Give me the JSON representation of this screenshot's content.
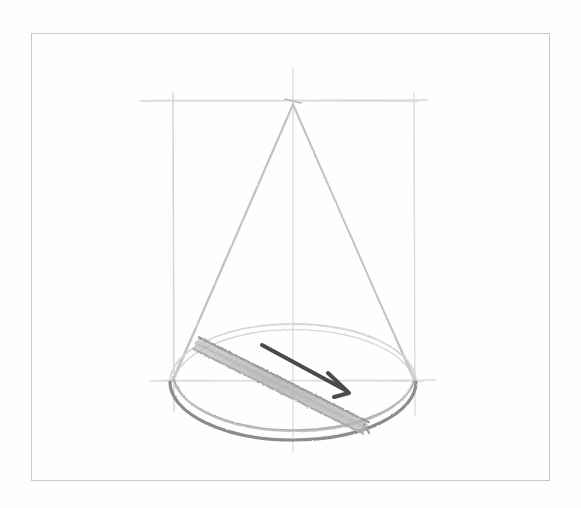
{
  "canvas": {
    "width": 581,
    "height": 508,
    "background_color": "#fefefe",
    "title": "Pencil sketch of a cone with diameter arrow"
  },
  "frame": {
    "name": "page-border",
    "x": 31,
    "y": 33,
    "width": 518,
    "height": 447,
    "stroke_color": "#c9c9c9",
    "stroke_width": 1
  },
  "palette": {
    "construction_line": "#cfcfcf",
    "faint_pencil": "#d6d6d6",
    "light_pencil": "#bdbdbd",
    "mid_pencil": "#a8a8a8",
    "dark_pencil": "#8c8c8c",
    "shade_band": "#b3b3b3",
    "arrow": "#4b4b4b",
    "frame": "#c9c9c9"
  },
  "construction": {
    "top_horizontal": {
      "label": "top-guide",
      "x1": 140,
      "y1": 101,
      "x2": 427,
      "y2": 100
    },
    "bottom_horizontal": {
      "label": "base-guide",
      "x1": 150,
      "y1": 381,
      "x2": 436,
      "y2": 380
    },
    "left_vertical": {
      "label": "left-guide",
      "x1": 173,
      "y1": 93,
      "x2": 174,
      "y2": 412
    },
    "right_vertical": {
      "label": "right-guide",
      "x1": 414,
      "y1": 93,
      "x2": 415,
      "y2": 416
    },
    "center_vertical": {
      "label": "axis-guide",
      "x1": 293,
      "y1": 68,
      "x2": 293,
      "y2": 452
    }
  },
  "cone": {
    "apex": {
      "x": 293,
      "y": 104
    },
    "left_slant": {
      "x1": 293,
      "y1": 104,
      "x2": 172,
      "y2": 381
    },
    "right_slant": {
      "x1": 293,
      "y1": 104,
      "x2": 416,
      "y2": 382
    },
    "base_ellipse": {
      "cx": 293,
      "cy": 382,
      "rx": 123,
      "ry": 58
    }
  },
  "diameter_band": {
    "label": "shaded-diameter-band",
    "start": {
      "x": 196,
      "y": 343
    },
    "end": {
      "x": 366,
      "y": 428
    },
    "band_width": 13
  },
  "arrow": {
    "label": "direction-arrow",
    "color": "#4b4b4b",
    "tail": {
      "x": 262,
      "y": 345
    },
    "tip": {
      "x": 349,
      "y": 393
    },
    "stroke_width": 4,
    "head_left": {
      "x": 328,
      "y": 373
    },
    "head_down": {
      "x": 334,
      "y": 397
    }
  }
}
